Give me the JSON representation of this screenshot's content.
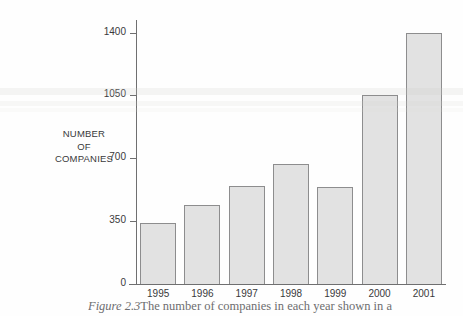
{
  "chart_data": {
    "type": "bar",
    "title": "",
    "xlabel": "",
    "ylabel": "NUMBER OF COMPANIES",
    "ylabel_lines": [
      "NUMBER",
      "OF",
      "COMPANIES"
    ],
    "categories": [
      "1995",
      "1996",
      "1997",
      "1998",
      "1999",
      "2000",
      "2001"
    ],
    "values": [
      340,
      440,
      545,
      670,
      540,
      1050,
      1400
    ],
    "ylim": [
      0,
      1470
    ],
    "yticks": [
      0,
      350,
      700,
      1050,
      1400
    ],
    "ytick_labels": [
      "0",
      "350",
      "700",
      "1050",
      "1400"
    ],
    "grid": false,
    "legend": null,
    "bar_fill_color": "#e2e2e2",
    "bar_edge_color": "#8d8d8e",
    "axis_color": "#6f6f70",
    "text_color": "#39393b"
  },
  "caption": {
    "figure_number": "Figure 2.3",
    "text": "The  number  of  companies  in  each  year  shown  in  a"
  }
}
